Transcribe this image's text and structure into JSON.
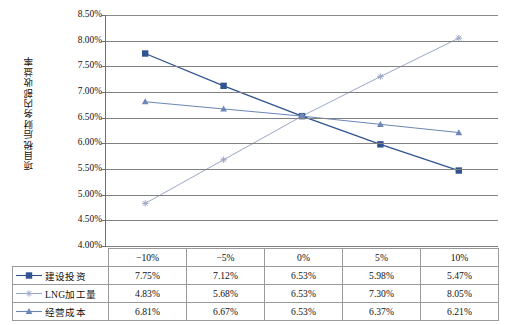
{
  "chart_data": {
    "type": "line",
    "title": "",
    "xlabel": "",
    "ylabel": "项目税后财务内部收益率",
    "categories": [
      "−10%",
      "−5%",
      "0%",
      "5%",
      "10%"
    ],
    "ylim": [
      4.0,
      8.5
    ],
    "ytick_step": 0.5,
    "ytick_labels": [
      "8.50%",
      "8.00%",
      "7.50%",
      "7.00%",
      "6.50%",
      "6.00%",
      "5.50%",
      "5.00%",
      "4.50%",
      "4.00%"
    ],
    "ytick_values": [
      8.5,
      8.0,
      7.5,
      7.0,
      6.5,
      6.0,
      5.5,
      5.0,
      4.5,
      4.0
    ],
    "grid": true,
    "legend_position": "table-first-column",
    "series": [
      {
        "name": "建设投资",
        "marker": "square",
        "color": "#31538f",
        "values": [
          7.75,
          7.12,
          6.53,
          5.98,
          5.47
        ],
        "labels": [
          "7.75%",
          "7.12%",
          "6.53%",
          "5.98%",
          "5.47%"
        ]
      },
      {
        "name": "LNG加工量",
        "marker": "star",
        "color": "#9aa8c4",
        "values": [
          4.83,
          5.68,
          6.53,
          7.3,
          8.05
        ],
        "labels": [
          "4.83%",
          "5.68%",
          "6.53%",
          "7.30%",
          "8.05%"
        ]
      },
      {
        "name": "经营成本",
        "marker": "triangle",
        "color": "#6c86b8",
        "values": [
          6.81,
          6.67,
          6.53,
          6.37,
          6.21
        ],
        "labels": [
          "6.81%",
          "6.67%",
          "6.53%",
          "6.37%",
          "6.21%"
        ]
      }
    ]
  },
  "table": {
    "corner_label": "",
    "column_headers": [
      "−10%",
      "−5%",
      "0%",
      "5%",
      "10%"
    ],
    "rows": [
      {
        "label": "建设投资",
        "marker": "square",
        "cells": [
          "7.75%",
          "7.12%",
          "6.53%",
          "5.98%",
          "5.47%"
        ]
      },
      {
        "label": "LNG加工量",
        "marker": "star",
        "cells": [
          "4.83%",
          "5.68%",
          "6.53%",
          "7.30%",
          "8.05%"
        ]
      },
      {
        "label": "经营成本",
        "marker": "triangle",
        "cells": [
          "6.81%",
          "6.67%",
          "6.53%",
          "6.37%",
          "6.21%"
        ]
      }
    ]
  },
  "colors": {
    "series1": "#31538f",
    "series2": "#9aa8c4",
    "series3": "#6c86b8",
    "grid": "#808080",
    "axis": "#6f6f6f",
    "table_border": "#9a9a9a"
  }
}
